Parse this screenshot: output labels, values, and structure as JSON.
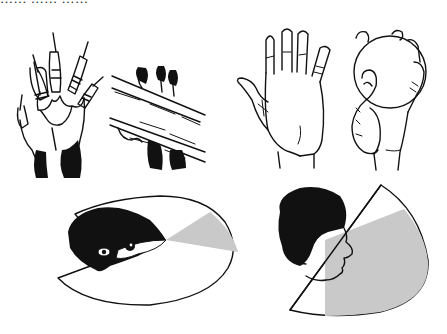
{
  "figure": {
    "type": "illustration",
    "cut_off_header_text": "…… …… ……",
    "panels": [
      {
        "id": "treeshrew-paw",
        "description": "clawed paw of a tree shrew, palm view"
      },
      {
        "id": "treeshrew-paws-on-branch",
        "description": "tree shrew paws clinging to a branch"
      },
      {
        "id": "human-open-hand",
        "description": "human hand, palm open"
      },
      {
        "id": "human-hand-gripping-ball",
        "description": "human hand gripping a ball"
      },
      {
        "id": "treeshrew-visual-field",
        "description": "tree shrew head with wide visual field and narrow binocular overlap (gray)"
      },
      {
        "id": "human-visual-field",
        "description": "human head in profile with narrower visual field and large binocular overlap (gray)"
      }
    ],
    "colors": {
      "ink": "#111111",
      "overlap_gray": "#c9c9c9",
      "background": "#ffffff"
    }
  }
}
